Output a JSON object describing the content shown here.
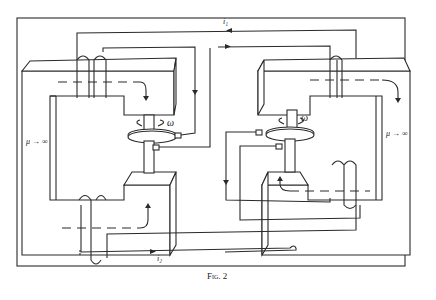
{
  "figure": {
    "caption": "Fig. 2",
    "labels": {
      "current_top": "i₁",
      "current_bottom": "i₂",
      "omega_left": "ω",
      "omega_right": "ω",
      "mu_left": "μ → ∞",
      "mu_right": "μ → ∞"
    },
    "components": [
      {
        "name": "left-electromagnet",
        "description": "C-shaped iron core with coil windings"
      },
      {
        "name": "right-electromagnet",
        "description": "C-shaped iron core with coil windings"
      },
      {
        "name": "left-faraday-disc",
        "description": "rotating disc with brushes"
      },
      {
        "name": "right-faraday-disc",
        "description": "rotating disc with brushes"
      }
    ],
    "colors": {
      "ink": "#2a2a2a",
      "paper": "#ffffff"
    }
  }
}
